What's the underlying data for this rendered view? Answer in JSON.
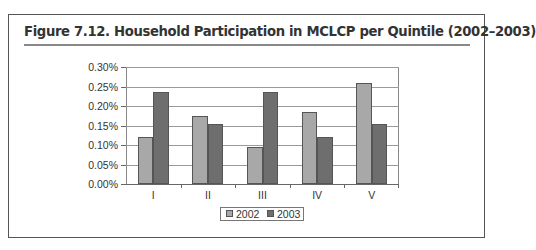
{
  "figure": {
    "title": "Figure 7.12.  Household Participation in MCLCP per Quintile (2002–2003)"
  },
  "chart_data": {
    "type": "bar",
    "title": "Household Participation in MCLCP per Quintile (2002–2003)",
    "xlabel": "",
    "ylabel": "",
    "categories": [
      "I",
      "II",
      "III",
      "IV",
      "V"
    ],
    "series": [
      {
        "name": "2002",
        "color": "#a8a8a8",
        "values": [
          0.12,
          0.175,
          0.095,
          0.185,
          0.26
        ]
      },
      {
        "name": "2003",
        "color": "#6e6e6e",
        "values": [
          0.235,
          0.155,
          0.235,
          0.12,
          0.155
        ]
      }
    ],
    "value_unit": "%",
    "ylim": [
      0,
      0.3
    ],
    "yticks": [
      "0.00%",
      "0.05%",
      "0.10%",
      "0.15%",
      "0.20%",
      "0.25%",
      "0.30%"
    ],
    "grid": true,
    "legend_position": "bottom"
  },
  "legend": {
    "items": [
      {
        "label": "2002",
        "color": "#a8a8a8"
      },
      {
        "label": "2003",
        "color": "#6e6e6e"
      }
    ]
  }
}
